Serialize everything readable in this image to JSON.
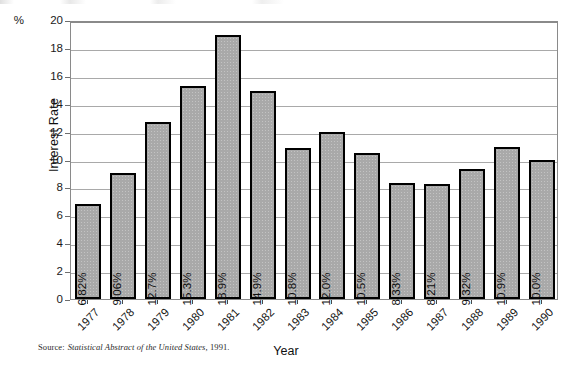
{
  "figure": {
    "y_axis_title": "Interest Rate",
    "x_axis_title": "Year",
    "percent_marker": "%",
    "source_prefix": "Source:",
    "source_title": "Statistical Abstract of the United States",
    "source_suffix": ", 1991."
  },
  "chart_data": {
    "type": "bar",
    "title": "",
    "xlabel": "Year",
    "ylabel": "Interest Rate",
    "ylim": [
      0,
      20
    ],
    "yticks": [
      0,
      2,
      4,
      6,
      8,
      10,
      12,
      14,
      16,
      18,
      20
    ],
    "ytick_labels": [
      "0",
      "2",
      "4",
      "6",
      "8",
      "10",
      "12",
      "14",
      "16",
      "18",
      "20"
    ],
    "y_unit": "%",
    "grid": true,
    "legend": false,
    "bar_color": "#A9A9A9",
    "bar_edge_color": "#000000",
    "categories": [
      "1977",
      "1978",
      "1979",
      "1980",
      "1981",
      "1982",
      "1983",
      "1984",
      "1985",
      "1986",
      "1987",
      "1988",
      "1989",
      "1990"
    ],
    "values": [
      6.82,
      9.06,
      12.7,
      15.3,
      18.9,
      14.9,
      10.8,
      12.0,
      10.5,
      8.33,
      8.21,
      9.32,
      10.9,
      10.0
    ],
    "data_labels": [
      "6.82%",
      "9.06%",
      "12.7%",
      "15.3%",
      "18.9%",
      "14.9%",
      "10.8%",
      "12.0%",
      "10.5%",
      "8.33%",
      "8.21%",
      "9.32%",
      "10.9%",
      "10.0%"
    ],
    "source": "Source: Statistical Abstract of the United States, 1991."
  }
}
